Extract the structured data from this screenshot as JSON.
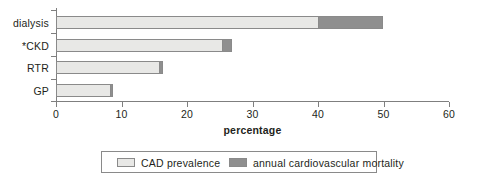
{
  "chart_data": {
    "type": "bar",
    "orientation": "horizontal",
    "stacked": true,
    "title": "",
    "xlabel": "percentage",
    "ylabel": "",
    "xlim": [
      0,
      60
    ],
    "xticks": [
      0,
      10,
      20,
      30,
      40,
      50,
      60
    ],
    "xticklabels": [
      "0",
      "10",
      "20",
      "30",
      "40",
      "50",
      "60"
    ],
    "grid": false,
    "categories": [
      "dialysis",
      "*CKD",
      "RTR",
      "GP"
    ],
    "series": [
      {
        "name": "CAD prevalence",
        "color": "#e8e8e6",
        "values": [
          40.0,
          25.4,
          15.8,
          8.3
        ]
      },
      {
        "name": "annual cardiovascular mortality",
        "color": "#8f8f8f",
        "values": [
          9.9,
          1.4,
          0.6,
          0.4
        ]
      }
    ],
    "totals": [
      49.9,
      26.8,
      16.4,
      8.7
    ],
    "legend": {
      "position": "bottom",
      "entries": [
        {
          "label": "CAD prevalence",
          "color": "#e8e8e6"
        },
        {
          "label": "annual cardiovascular mortality",
          "color": "#8f8f8f"
        }
      ]
    }
  },
  "axis": {
    "x_title": "percentage",
    "ticks": [
      "0",
      "10",
      "20",
      "30",
      "40",
      "50",
      "60"
    ]
  },
  "categories": [
    {
      "label": "dialysis"
    },
    {
      "label": "*CKD"
    },
    {
      "label": "RTR"
    },
    {
      "label": "GP"
    }
  ],
  "legend": {
    "prevalence_label": "CAD prevalence",
    "mortality_label": "annual cardiovascular mortality"
  },
  "colors": {
    "prevalence": "#e8e8e6",
    "mortality": "#8f8f8f",
    "axis": "#7f7f7f",
    "text": "#231f20"
  }
}
